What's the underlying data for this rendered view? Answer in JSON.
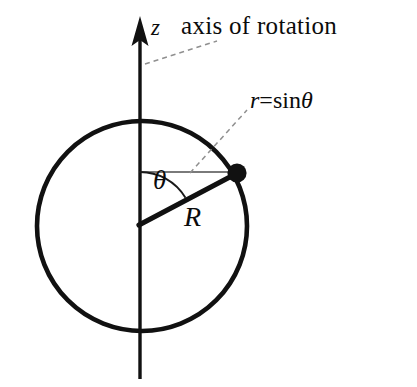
{
  "figure": {
    "background_color": "#ffffff",
    "stroke_color": "#000000",
    "thin_stroke_color": "#4a4a4a",
    "dash_color": "#8a8a8a",
    "width": 417,
    "height": 387
  },
  "labels": {
    "z_axis": "z",
    "axis_of_rotation": "axis of rotation",
    "radius_formula_var": "r",
    "radius_formula_eq": "=",
    "radius_formula_fn": "sin",
    "radius_formula_arg": "θ",
    "angle": "θ",
    "sphere_radius": "R"
  },
  "geometry": {
    "circle": {
      "cx": 142,
      "cy": 226,
      "r": 105,
      "stroke_width": 4.6
    },
    "axis": {
      "x": 140,
      "y_top": 17,
      "y_bottom": 379,
      "stroke_width": 3.6
    },
    "arrow": {
      "tip_x": 140,
      "tip_y": 17,
      "half_width": 8,
      "length": 30
    },
    "point": {
      "cx": 237,
      "cy": 173,
      "r": 9.5
    },
    "radius_line": {
      "x1": 139,
      "y1": 224,
      "x2": 237,
      "y2": 173,
      "stroke_width": 5
    },
    "r_segment": {
      "x1": 140,
      "y1": 172,
      "x2": 237,
      "y2": 172,
      "stroke_width": 1.6
    },
    "angle_arc": {
      "cx": 139,
      "cy": 224,
      "r": 52,
      "start_deg": 0,
      "end_deg": 27
    },
    "leader_axis": {
      "x1": 146,
      "y1": 63,
      "x2": 216,
      "y2": 42
    },
    "leader_r": {
      "x1": 191,
      "y1": 172,
      "x2": 246,
      "y2": 111
    }
  }
}
